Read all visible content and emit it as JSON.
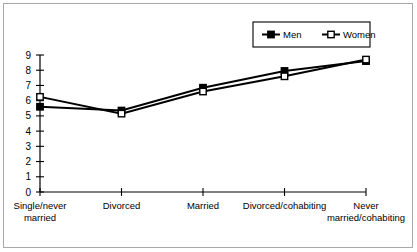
{
  "chart_data": {
    "type": "line",
    "title": "",
    "subtitle": "",
    "xlabel": "",
    "ylabel": "",
    "categories": [
      "Single/never married",
      "Divorced",
      "Married",
      "Divorced/cohabiting",
      "Never married/cohabiting"
    ],
    "category_lines": [
      [
        "Single/never",
        "married"
      ],
      [
        "Divorced"
      ],
      [
        "Married"
      ],
      [
        "Divorced/cohabiting"
      ],
      [
        "Never",
        "married/cohabiting"
      ]
    ],
    "series": [
      {
        "name": "Men",
        "marker": "filled-square",
        "color": "#000000",
        "values": [
          5.6,
          5.35,
          6.85,
          7.95,
          8.6
        ]
      },
      {
        "name": "Women",
        "marker": "open-square",
        "color": "#000000",
        "values": [
          6.25,
          5.15,
          6.6,
          7.6,
          8.7
        ]
      }
    ],
    "ylim": [
      0,
      9
    ],
    "yticks": [
      0,
      1,
      2,
      3,
      4,
      5,
      6,
      7,
      8,
      9
    ],
    "ytick_labels": [
      "0",
      "1",
      "2",
      "3",
      "4",
      "5",
      "6",
      "7",
      "8",
      "9"
    ],
    "grid": false,
    "legend_position": "top-right",
    "legend_entries": [
      "Men",
      "Women"
    ]
  },
  "figure": {
    "border_color": "#a8a8a8",
    "background": "#ffffff",
    "axis_color": "#000000"
  }
}
